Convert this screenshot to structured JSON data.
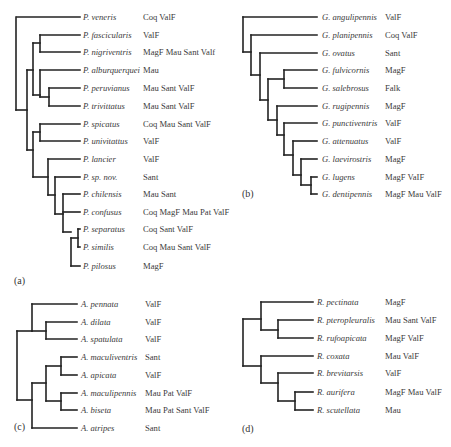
{
  "figure": {
    "panels": [
      {
        "id": "a",
        "label": "(a)",
        "label_pos": [
          14,
          284
        ],
        "name_x": 83,
        "region_x": 143,
        "leaves": [
          {
            "name": "P. veneris",
            "regions": "Coq ValF",
            "y": 17
          },
          {
            "name": "P. fascicularis",
            "regions": "ValF",
            "y": 35
          },
          {
            "name": "P. nigriventris",
            "regions": "MagF Mau Sant Valf",
            "y": 52
          },
          {
            "name": "P. alburquerquei",
            "regions": "Mau",
            "y": 70
          },
          {
            "name": "P. peruvianus",
            "regions": "Mau Sant ValF",
            "y": 88
          },
          {
            "name": "P. trivittatus",
            "regions": "Mau Sant ValF",
            "y": 106
          },
          {
            "name": "P. spicatus",
            "regions": "Coq Mau Sant ValF",
            "y": 124
          },
          {
            "name": "P. univitattus",
            "regions": "ValF",
            "y": 141
          },
          {
            "name": "P. lancier",
            "regions": "ValF",
            "y": 159
          },
          {
            "name": "P. sp. nov.",
            "regions": "Sant",
            "y": 177
          },
          {
            "name": "P. chilensis",
            "regions": "Mau Sant",
            "y": 194
          },
          {
            "name": "P. confusus",
            "regions": "Coq MagF Mau Pat ValF",
            "y": 212
          },
          {
            "name": "P. separatus",
            "regions": "Coq Sant ValF",
            "y": 229
          },
          {
            "name": "P. similis",
            "regions": "Coq Mau Sant ValF",
            "y": 247
          },
          {
            "name": "P. pilosus",
            "regions": "MagF",
            "y": 266
          }
        ],
        "leaf_end_x": 80,
        "leaf_start_x": [
          17,
          40,
          40,
          40,
          49,
          49,
          40,
          40,
          48,
          55,
          63,
          63,
          78,
          78,
          71
        ],
        "nodes": [
          {
            "x": 16,
            "y1": 17,
            "y2": 110
          },
          {
            "x": 27,
            "y1": 70,
            "y2": 150
          },
          {
            "x": 33,
            "y1": 43,
            "y2": 95
          },
          {
            "x": 40,
            "y1": 35,
            "y2": 52
          },
          {
            "x": 40,
            "y1": 70,
            "y2": 97
          },
          {
            "x": 49,
            "y1": 88,
            "y2": 106
          },
          {
            "x": 33,
            "y1": 132,
            "y2": 177
          },
          {
            "x": 40,
            "y1": 124,
            "y2": 141
          },
          {
            "x": 48,
            "y1": 159,
            "y2": 195
          },
          {
            "x": 55,
            "y1": 177,
            "y2": 214
          },
          {
            "x": 63,
            "y1": 194,
            "y2": 232
          },
          {
            "x": 71,
            "y1": 238,
            "y2": 266
          },
          {
            "x": 78,
            "y1": 229,
            "y2": 247
          }
        ],
        "links": [
          {
            "x1": 16,
            "x2": 27,
            "y": 110
          },
          {
            "x1": 27,
            "x2": 33,
            "y": 70
          },
          {
            "x1": 33,
            "x2": 40,
            "y": 43
          },
          {
            "x1": 33,
            "x2": 40,
            "y": 95
          },
          {
            "x1": 40,
            "x2": 49,
            "y": 97
          },
          {
            "x1": 27,
            "x2": 33,
            "y": 150
          },
          {
            "x1": 33,
            "x2": 40,
            "y": 132
          },
          {
            "x1": 33,
            "x2": 48,
            "y": 177
          },
          {
            "x1": 48,
            "x2": 55,
            "y": 195
          },
          {
            "x1": 55,
            "x2": 63,
            "y": 214
          },
          {
            "x1": 63,
            "x2": 71,
            "y": 232
          },
          {
            "x1": 71,
            "x2": 78,
            "y": 238
          }
        ]
      },
      {
        "id": "b",
        "label": "(b)",
        "label_pos": [
          242,
          197
        ],
        "name_x": 322,
        "region_x": 385,
        "leaves": [
          {
            "name": "G. angulipennis",
            "regions": "ValF",
            "y": 17
          },
          {
            "name": "G. planipennis",
            "regions": "Coq ValF",
            "y": 35
          },
          {
            "name": "G. ovatus",
            "regions": "Sant",
            "y": 53
          },
          {
            "name": "G. fulvicornis",
            "regions": "MagF",
            "y": 70
          },
          {
            "name": "G. salebrosus",
            "regions": "Falk",
            "y": 88
          },
          {
            "name": "G. rugipennis",
            "regions": "MagF",
            "y": 106
          },
          {
            "name": "G. punctiventris",
            "regions": "ValF",
            "y": 123
          },
          {
            "name": "G. attenuatus",
            "regions": "ValF",
            "y": 141
          },
          {
            "name": "G. laevirostris",
            "regions": "MagF",
            "y": 159
          },
          {
            "name": "G. lugens",
            "regions": "MagF VaIF",
            "y": 177
          },
          {
            "name": "G. dentipennis",
            "regions": "MagF Mau ValF",
            "y": 194
          }
        ],
        "leaf_end_x": 317,
        "leaf_start_x": [
          243,
          251,
          260,
          284,
          284,
          277,
          284,
          293,
          301,
          311,
          311
        ],
        "nodes": [
          {
            "x": 243,
            "y1": 17,
            "y2": 52
          },
          {
            "x": 251,
            "y1": 35,
            "y2": 75
          },
          {
            "x": 260,
            "y1": 53,
            "y2": 100
          },
          {
            "x": 268,
            "y1": 79,
            "y2": 120
          },
          {
            "x": 284,
            "y1": 70,
            "y2": 88
          },
          {
            "x": 277,
            "y1": 106,
            "y2": 135
          },
          {
            "x": 284,
            "y1": 123,
            "y2": 155
          },
          {
            "x": 293,
            "y1": 141,
            "y2": 175
          },
          {
            "x": 301,
            "y1": 159,
            "y2": 185
          },
          {
            "x": 311,
            "y1": 177,
            "y2": 194
          }
        ],
        "links": [
          {
            "x1": 243,
            "x2": 251,
            "y": 52
          },
          {
            "x1": 251,
            "x2": 260,
            "y": 75
          },
          {
            "x1": 260,
            "x2": 268,
            "y": 100
          },
          {
            "x1": 268,
            "x2": 284,
            "y": 79
          },
          {
            "x1": 268,
            "x2": 277,
            "y": 120
          },
          {
            "x1": 277,
            "x2": 284,
            "y": 135
          },
          {
            "x1": 284,
            "x2": 293,
            "y": 155
          },
          {
            "x1": 293,
            "x2": 301,
            "y": 175
          },
          {
            "x1": 301,
            "x2": 311,
            "y": 185
          }
        ]
      },
      {
        "id": "c",
        "label": "(c)",
        "label_pos": [
          14,
          430
        ],
        "name_x": 81,
        "region_x": 145,
        "leaves": [
          {
            "name": "A. pennata",
            "regions": "ValF",
            "y": 304
          },
          {
            "name": "A. dilata",
            "regions": "ValF",
            "y": 322
          },
          {
            "name": "A. spatulata",
            "regions": "ValF",
            "y": 339
          },
          {
            "name": "A. maculiventris",
            "regions": "Sant",
            "y": 357
          },
          {
            "name": "A. apicata",
            "regions": "ValF",
            "y": 375
          },
          {
            "name": "A. maculipennis",
            "regions": "Mau Pat ValF",
            "y": 393
          },
          {
            "name": "A. biseta",
            "regions": "Mau Pat Sant ValF",
            "y": 410
          },
          {
            "name": "A. atripes",
            "regions": "Sant",
            "y": 428
          }
        ],
        "leaf_end_x": 77,
        "leaf_start_x": [
          32,
          46,
          46,
          61,
          61,
          61,
          61,
          32
        ],
        "nodes": [
          {
            "x": 17,
            "y1": 331,
            "y2": 400
          },
          {
            "x": 32,
            "y1": 304,
            "y2": 331
          },
          {
            "x": 46,
            "y1": 322,
            "y2": 339
          },
          {
            "x": 32,
            "y1": 383,
            "y2": 428
          },
          {
            "x": 46,
            "y1": 366,
            "y2": 401
          },
          {
            "x": 61,
            "y1": 357,
            "y2": 375
          },
          {
            "x": 61,
            "y1": 393,
            "y2": 410
          }
        ],
        "links": [
          {
            "x1": 17,
            "x2": 32,
            "y": 331
          },
          {
            "x1": 32,
            "x2": 46,
            "y": 331
          },
          {
            "x1": 17,
            "x2": 32,
            "y": 400
          },
          {
            "x1": 32,
            "x2": 46,
            "y": 383
          },
          {
            "x1": 46,
            "x2": 61,
            "y": 366
          },
          {
            "x1": 46,
            "x2": 61,
            "y": 401
          }
        ]
      },
      {
        "id": "d",
        "label": "(d)",
        "label_pos": [
          242,
          432
        ],
        "name_x": 317,
        "region_x": 385,
        "leaves": [
          {
            "name": "R. pectinata",
            "regions": "MagF",
            "y": 302
          },
          {
            "name": "R. pteropleuralis",
            "regions": "Mau Sant ValF",
            "y": 320
          },
          {
            "name": "R. rufoapicata",
            "regions": "MagF ValF",
            "y": 338
          },
          {
            "name": "R. coxata",
            "regions": "Mau ValF",
            "y": 356
          },
          {
            "name": "R. brevitarsis",
            "regions": "ValF",
            "y": 373
          },
          {
            "name": "R. aurifera",
            "regions": "MagF Mau ValF",
            "y": 392
          },
          {
            "name": "R. scutellata",
            "regions": "Mau",
            "y": 410
          }
        ],
        "leaf_end_x": 313,
        "leaf_start_x": [
          261,
          278,
          278,
          261,
          278,
          295,
          295
        ],
        "nodes": [
          {
            "x": 243,
            "y1": 319,
            "y2": 366
          },
          {
            "x": 261,
            "y1": 302,
            "y2": 330
          },
          {
            "x": 278,
            "y1": 320,
            "y2": 338
          },
          {
            "x": 261,
            "y1": 356,
            "y2": 383
          },
          {
            "x": 278,
            "y1": 373,
            "y2": 401
          },
          {
            "x": 295,
            "y1": 392,
            "y2": 410
          }
        ],
        "links": [
          {
            "x1": 243,
            "x2": 261,
            "y": 319
          },
          {
            "x1": 261,
            "x2": 278,
            "y": 330
          },
          {
            "x1": 243,
            "x2": 261,
            "y": 366
          },
          {
            "x1": 261,
            "x2": 278,
            "y": 383
          },
          {
            "x1": 278,
            "x2": 295,
            "y": 401
          }
        ]
      }
    ]
  }
}
